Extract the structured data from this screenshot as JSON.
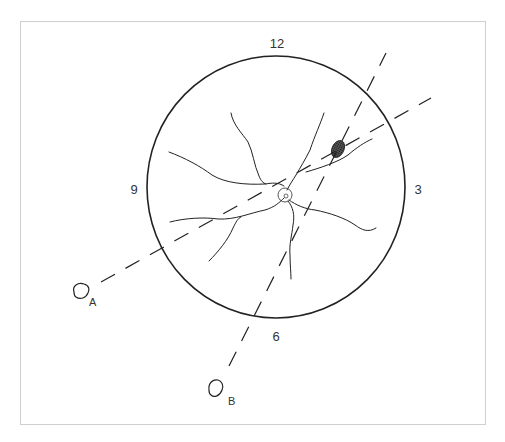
{
  "diagram": {
    "type": "fundus-clock-diagram",
    "colors": {
      "line": "#222222",
      "frame": "#cfcfcf",
      "lesion": "#333333",
      "background": "#ffffff"
    },
    "clock_labels": [
      {
        "id": "12",
        "text": "12",
        "x": 277,
        "y": 43
      },
      {
        "id": "3",
        "text": "3",
        "x": 418,
        "y": 189
      },
      {
        "id": "9",
        "text": "9",
        "x": 134,
        "y": 189
      },
      {
        "id": "6",
        "text": "6",
        "x": 276,
        "y": 336
      }
    ],
    "fundus_circle": {
      "cx": 276,
      "cy": 187,
      "rx": 129,
      "ry": 131
    },
    "optic_disc": {
      "cx": 285,
      "cy": 195,
      "r": 7
    },
    "lesion": {
      "cx": 338,
      "cy": 149,
      "rx": 6,
      "ry": 9,
      "rotate": 25
    },
    "dashed_lines": [
      {
        "id": "A",
        "x1": 101,
        "y1": 282,
        "x2": 431,
        "y2": 98
      },
      {
        "id": "B",
        "x1": 229,
        "y1": 366,
        "x2": 386,
        "y2": 53
      }
    ],
    "light_sources": [
      {
        "id": "A",
        "label": "A",
        "cx": 80,
        "cy": 292,
        "label_x": 89,
        "label_y": 297
      },
      {
        "id": "B",
        "label": "B",
        "cx": 215,
        "cy": 390,
        "label_x": 228,
        "label_y": 396
      }
    ]
  }
}
